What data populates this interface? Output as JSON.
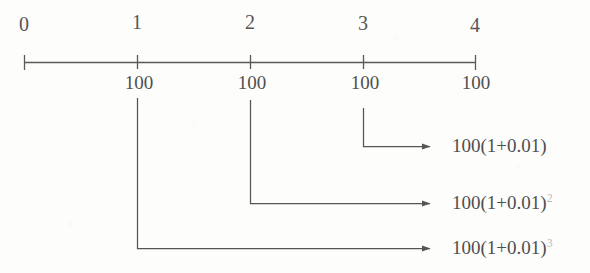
{
  "figure": {
    "type": "timeline-diagram",
    "ink_color": "#4f4f4f",
    "background_color": "#fdfdfb",
    "axis": {
      "label": "",
      "tick_labels": [
        "0",
        "1",
        "2",
        "3",
        "4"
      ],
      "tick_positions": [
        24,
        137,
        250,
        363,
        475
      ],
      "axis_y": 62,
      "line_start_x": 24,
      "line_end_x": 475
    },
    "deposits": {
      "label_text": "100",
      "labels": [
        "100",
        "100",
        "100",
        "100"
      ],
      "at_ticks": [
        1,
        2,
        3,
        4
      ],
      "positions_x": [
        137,
        250,
        363,
        475
      ],
      "baseline_y": 88
    },
    "arrows": [
      {
        "name": "arrow-from-period-3",
        "from_tick": 3,
        "start_x": 363,
        "start_y": 108,
        "corner_y": 146,
        "end_x": 437,
        "label": "100(1+0.01)",
        "exponent": "",
        "label_x": 452,
        "label_y": 146
      },
      {
        "name": "arrow-from-period-2",
        "from_tick": 2,
        "start_x": 250,
        "start_y": 100,
        "corner_y": 203,
        "end_x": 437,
        "label": "100(1+0.01)",
        "exponent": "2",
        "label_x": 452,
        "label_y": 203
      },
      {
        "name": "arrow-from-period-1",
        "from_tick": 1,
        "start_x": 137,
        "start_y": 98,
        "corner_y": 248,
        "end_x": 437,
        "label": "100(1+0.01)",
        "exponent": "3",
        "label_x": 452,
        "label_y": 248
      }
    ]
  }
}
